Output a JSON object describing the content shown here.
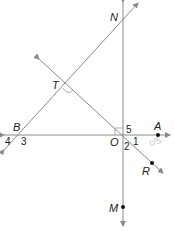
{
  "diagram": {
    "type": "geometry-lines",
    "colors": {
      "line": "#8a8a8a",
      "label": "#222222",
      "point": "#111111",
      "handwriting": "#b8c4d8"
    },
    "points": {
      "N": {
        "label": "N"
      },
      "T": {
        "label": "T"
      },
      "B": {
        "label": "B"
      },
      "O": {
        "label": "O"
      },
      "A": {
        "label": "A"
      },
      "R": {
        "label": "R"
      },
      "M": {
        "label": "M"
      }
    },
    "angle_labels": {
      "a1": "1",
      "a2": "2",
      "a3": "3",
      "a4": "4",
      "a5": "5"
    },
    "handwritten_note": "c/5",
    "lines": [
      {
        "name": "line-BN",
        "through": [
          "B",
          "T",
          "N"
        ]
      },
      {
        "name": "line-TR",
        "through": [
          "T",
          "O",
          "R"
        ]
      },
      {
        "name": "line-BA",
        "through": [
          "B",
          "O",
          "A"
        ]
      },
      {
        "name": "line-NM",
        "through": [
          "N",
          "O",
          "M"
        ]
      }
    ],
    "right_angle_marks": [
      "T",
      "O"
    ]
  }
}
